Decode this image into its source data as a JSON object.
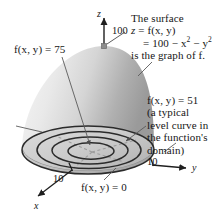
{
  "figure": {
    "title_note": {
      "line1": "The surface",
      "line2_prefix": "z",
      "line2_eq": " = f(x, y)",
      "line3": "= 100 − x",
      "line3_sup1": "2",
      "line3_mid": " − y",
      "line3_sup2": "2",
      "line4": "is the graph of f."
    },
    "level_note": {
      "line1": "f(x, y) = 51",
      "line2": "(a typical",
      "line3": "level curve in",
      "line4": "the function's",
      "line5": "domain)"
    },
    "label_75": "f(x, y) = 75",
    "label_0": "f(x, y) = 0",
    "z_max_tick": "100",
    "y_tick": "10",
    "x_tick": "10",
    "axis_z": "z",
    "axis_y": "y",
    "axis_x": "x",
    "colors": {
      "surface_light": "#f4f4f4",
      "surface_mid": "#d8d8d8",
      "surface_dark": "#9d9d9d",
      "base_fill": "#c3c3c3",
      "curve_stroke": "#2b2b2b",
      "leader_stroke": "#5a5a5a",
      "axis_stroke": "#1f1f1f",
      "dashed_stroke": "#8d8d8d",
      "text": "#161616"
    },
    "level_curve_values": [
      0,
      51,
      75,
      100
    ],
    "apex": {
      "x": 104,
      "y": 46,
      "z_value": 100
    },
    "base_center": {
      "x": 88,
      "y": 150
    },
    "base_radii": {
      "rx": 66,
      "ry": 24
    }
  }
}
